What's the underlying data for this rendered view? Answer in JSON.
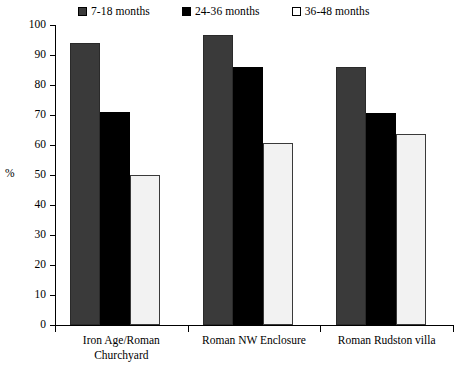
{
  "chart_data": {
    "type": "bar",
    "title": "",
    "subtitle": "",
    "xlabel": "",
    "ylabel": "%",
    "ylim": [
      0,
      100
    ],
    "yticks": [
      0,
      10,
      20,
      30,
      40,
      50,
      60,
      70,
      80,
      90,
      100
    ],
    "grid": false,
    "legend_position": "top",
    "categories": [
      "Iron Age/Roman Churchyard",
      "Roman NW Enclosure",
      "Roman Rudston villa"
    ],
    "category_lines": [
      [
        "Iron Age/Roman",
        "Churchyard"
      ],
      [
        "Roman NW Enclosure"
      ],
      [
        "Roman Rudston villa"
      ]
    ],
    "series": [
      {
        "name": "7-18 months",
        "color": "#3a3a3a",
        "values": [
          94,
          96.5,
          86
        ]
      },
      {
        "name": "24-36 months",
        "color": "#000000",
        "values": [
          71,
          86,
          70.5
        ]
      },
      {
        "name": "36-48 months",
        "color": "#f2f2f2",
        "values": [
          50,
          60.5,
          63.5
        ]
      }
    ]
  },
  "legend": {
    "items": [
      {
        "label": "7-18 months",
        "swatch": "dark-gray-square"
      },
      {
        "label": "24-36 months",
        "swatch": "black-square"
      },
      {
        "label": "36-48 months",
        "swatch": "white-square"
      }
    ]
  },
  "axis": {
    "y_axis_label": "%",
    "y_tick_labels": [
      "100",
      "90",
      "80",
      "70",
      "60",
      "50",
      "40",
      "30",
      "20",
      "10",
      "0"
    ]
  }
}
